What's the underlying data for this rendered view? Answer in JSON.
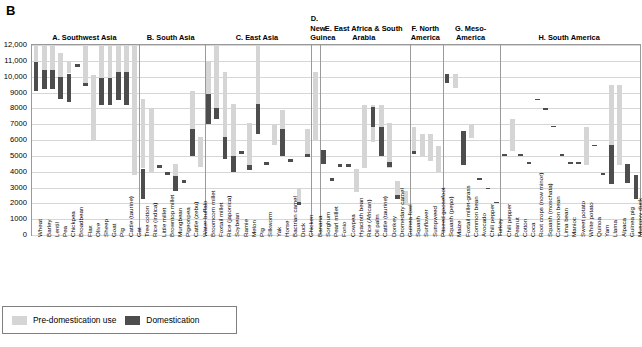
{
  "panel_letter": "B",
  "axis": {
    "ylabel": "Years BP",
    "ymin": 0,
    "ymax": 12000,
    "yticks": [
      "0",
      "1000",
      "2000",
      "3000",
      "4000",
      "5000",
      "6000",
      "7000",
      "8000",
      "9000",
      "10,000",
      "11,000",
      "12,000"
    ],
    "ytick_values": [
      0,
      1000,
      2000,
      3000,
      4000,
      5000,
      6000,
      7000,
      8000,
      9000,
      10000,
      11000,
      12000
    ]
  },
  "legend": {
    "position": "bottom-left",
    "items": [
      {
        "key": "pre",
        "label": "Pre-domestication use",
        "color": "#d5d5d5"
      },
      {
        "key": "dom",
        "label": "Domestication",
        "color": "#4d4d4d"
      }
    ]
  },
  "chart_data": {
    "type": "bar",
    "orientation": "vertical-range",
    "title": "",
    "xlabel": "",
    "ylabel": "Years BP",
    "ylim": [
      0,
      12000
    ],
    "grid": true,
    "series": [
      {
        "name": "Pre-domestication use",
        "color": "#d5d5d5"
      },
      {
        "name": "Domestication",
        "color": "#4d4d4d"
      }
    ],
    "groups": [
      {
        "id": "A",
        "label": "A. Southwest Asia",
        "items": [
          {
            "name": "Wheat",
            "pre": [
              10900,
              12000
            ],
            "dom": [
              9100,
              10900
            ]
          },
          {
            "name": "Barley",
            "pre": [
              10400,
              12000
            ],
            "dom": [
              9200,
              10400
            ]
          },
          {
            "name": "Lentil",
            "pre": [
              10400,
              12000
            ],
            "dom": [
              9200,
              10400
            ]
          },
          {
            "name": "Pea",
            "pre": [
              10000,
              11500
            ],
            "dom": [
              8600,
              10000
            ]
          },
          {
            "name": "Chickpea",
            "pre": [
              10200,
              10900
            ],
            "dom": [
              8400,
              10200
            ]
          },
          {
            "name": "Broadbean",
            "pre": null,
            "dom": [
              10600,
              10800
            ]
          },
          {
            "name": "Flax",
            "pre": [
              9500,
              12000
            ],
            "dom": [
              9400,
              9600
            ]
          },
          {
            "name": "Olive",
            "pre": [
              6000,
              10100
            ],
            "dom": null
          },
          {
            "name": "Sheep",
            "pre": [
              9900,
              12000
            ],
            "dom": [
              8200,
              9900
            ]
          },
          {
            "name": "Goat",
            "pre": [
              9900,
              12000
            ],
            "dom": [
              8200,
              9900
            ]
          },
          {
            "name": "Pig",
            "pre": [
              10300,
              12000
            ],
            "dom": [
              8500,
              10300
            ]
          },
          {
            "name": "Cattle (taurine)",
            "pre": [
              10300,
              12000
            ],
            "dom": [
              8200,
              10300
            ]
          },
          {
            "name": "Cat",
            "pre": [
              3800,
              12000
            ],
            "dom": null
          }
        ]
      },
      {
        "id": "B",
        "label": "B. South Asia",
        "items": [
          {
            "name": "Tree cotton",
            "pre": [
              4200,
              8600
            ],
            "dom": [
              2300,
              4200
            ]
          },
          {
            "name": "Rice (indica)",
            "pre": [
              4000,
              8000
            ],
            "dom": null
          },
          {
            "name": "Little millet",
            "pre": null,
            "dom": [
              4200,
              4400
            ]
          },
          {
            "name": "Browntop millet",
            "pre": null,
            "dom": [
              3800,
              4000
            ]
          },
          {
            "name": "Mungbean",
            "pre": [
              3700,
              4500
            ],
            "dom": [
              2800,
              3700
            ]
          },
          {
            "name": "Pigeonpea",
            "pre": null,
            "dom": [
              3300,
              3500
            ]
          },
          {
            "name": "Cattle (zebu)",
            "pre": [
              6700,
              9100
            ],
            "dom": [
              5000,
              6700
            ]
          },
          {
            "name": "Water buffalo",
            "pre": [
              4300,
              6200
            ],
            "dom": null
          }
        ]
      },
      {
        "id": "C",
        "label": "C. East Asia",
        "items": [
          {
            "name": "Broomcorn millet",
            "pre": [
              8900,
              11000
            ],
            "dom": [
              7000,
              8900
            ]
          },
          {
            "name": "Foxtail millet",
            "pre": [
              8000,
              12000
            ],
            "dom": [
              7300,
              8000
            ]
          },
          {
            "name": "Rice (japonica)",
            "pre": [
              6200,
              10300
            ],
            "dom": [
              4800,
              6200
            ]
          },
          {
            "name": "Soybean",
            "pre": [
              5000,
              8300
            ],
            "dom": [
              4000,
              5000
            ]
          },
          {
            "name": "Ramie",
            "pre": null,
            "dom": [
              5100,
              5300
            ]
          },
          {
            "name": "Melon",
            "pre": [
              4100,
              7100
            ],
            "dom": [
              4100,
              4400
            ]
          },
          {
            "name": "Pig",
            "pre": [
              8300,
              12000
            ],
            "dom": [
              6400,
              8300
            ]
          },
          {
            "name": "Silkworm",
            "pre": null,
            "dom": [
              4400,
              4600
            ]
          },
          {
            "name": "Yak",
            "pre": [
              5700,
              7000
            ],
            "dom": null
          },
          {
            "name": "Horse",
            "pre": [
              6700,
              7900
            ],
            "dom": [
              5000,
              6700
            ]
          },
          {
            "name": "Bactrian camel",
            "pre": null,
            "dom": [
              4600,
              4800
            ]
          },
          {
            "name": "Duck",
            "pre": [
              2000,
              3000
            ],
            "dom": [
              1900,
              2100
            ]
          },
          {
            "name": "Chicken",
            "pre": [
              5000,
              6700
            ],
            "dom": [
              4900,
              5100
            ]
          }
        ]
      },
      {
        "id": "D",
        "label": "D. New Guinea",
        "items": [
          {
            "name": "Banana",
            "pre": [
              6000,
              10300
            ],
            "dom": null
          }
        ]
      },
      {
        "id": "E",
        "label": "E. East Africa & South Arabia",
        "items": [
          {
            "name": "Sorghum",
            "pre": null,
            "dom": [
              4500,
              5400
            ]
          },
          {
            "name": "Pearl millet",
            "pre": null,
            "dom": [
              3400,
              3600
            ]
          },
          {
            "name": "Fonio",
            "pre": null,
            "dom": [
              4300,
              4500
            ]
          },
          {
            "name": "Cowpea",
            "pre": null,
            "dom": [
              4300,
              4500
            ]
          },
          {
            "name": "Hyacinth bean",
            "pre": [
              2700,
              4200
            ],
            "dom": null
          },
          {
            "name": "Rice (African)",
            "pre": [
              4200,
              8200
            ],
            "dom": null
          },
          {
            "name": "Oil palm",
            "pre": [
              5900,
              8200
            ],
            "dom": [
              6800,
              8100
            ]
          },
          {
            "name": "Cattle (taurine)",
            "pre": [
              5000,
              8200
            ],
            "dom": [
              5000,
              6800
            ]
          },
          {
            "name": "Donkey",
            "pre": [
              4200,
              7100
            ],
            "dom": [
              4300,
              4600
            ]
          },
          {
            "name": "Dromedary camel",
            "pre": [
              2300,
              3400
            ],
            "dom": [
              2300,
              2500
            ]
          },
          {
            "name": "Guinea fowl",
            "pre": [
              1900,
              2800
            ],
            "dom": null
          }
        ]
      },
      {
        "id": "F",
        "label": "F. North America",
        "items": [
          {
            "name": "Squash",
            "pre": [
              5200,
              6800
            ],
            "dom": [
              5100,
              5300
            ]
          },
          {
            "name": "Sunflower",
            "pre": [
              5000,
              6400
            ],
            "dom": null
          },
          {
            "name": "Sumpweed",
            "pre": [
              4700,
              6400
            ],
            "dom": null
          },
          {
            "name": "Pitseed goosefoot",
            "pre": [
              4000,
              5600
            ],
            "dom": null
          }
        ]
      },
      {
        "id": "G",
        "label": "G. Meso-America",
        "items": [
          {
            "name": "Squash (pepo)",
            "pre": null,
            "dom": [
              9600,
              10200
            ]
          },
          {
            "name": "Maize",
            "pre": [
              9300,
              10200
            ],
            "dom": null
          },
          {
            "name": "Foxtail millet-grass",
            "pre": null,
            "dom": [
              4400,
              6600
            ]
          },
          {
            "name": "Common bean",
            "pre": [
              6100,
              7000
            ],
            "dom": null
          },
          {
            "name": "Avocado",
            "pre": null,
            "dom": [
              3500,
              3600
            ]
          },
          {
            "name": "Chili pepper",
            "pre": null,
            "dom": [
              2900,
              3000
            ]
          },
          {
            "name": "Turkey",
            "pre": null,
            "dom": [
              2000,
              2100
            ]
          }
        ]
      },
      {
        "id": "H",
        "label": "H. South America",
        "items": [
          {
            "name": "Chili pepper",
            "pre": null,
            "dom": [
              5000,
              5100
            ]
          },
          {
            "name": "Peanut",
            "pre": [
              5300,
              7300
            ],
            "dom": null
          },
          {
            "name": "Cotton",
            "pre": null,
            "dom": [
              5000,
              5100
            ]
          },
          {
            "name": "Coca",
            "pre": null,
            "dom": [
              4500,
              4600
            ]
          },
          {
            "name": "Root crops (now minor)",
            "pre": null,
            "dom": [
              8500,
              8600
            ]
          },
          {
            "name": "Squash (moschata)",
            "pre": null,
            "dom": [
              7900,
              8000
            ]
          },
          {
            "name": "Common bean",
            "pre": null,
            "dom": [
              6800,
              6900
            ]
          },
          {
            "name": "Lima bean",
            "pre": null,
            "dom": [
              5000,
              5100
            ]
          },
          {
            "name": "Manioc",
            "pre": null,
            "dom": [
              4500,
              4600
            ]
          },
          {
            "name": "Sweet potato",
            "pre": null,
            "dom": [
              4500,
              4600
            ]
          },
          {
            "name": "White potato",
            "pre": [
              4400,
              6800
            ],
            "dom": null
          },
          {
            "name": "Quinoa",
            "pre": null,
            "dom": [
              5600,
              5700
            ]
          },
          {
            "name": "Yam",
            "pre": null,
            "dom": [
              3800,
              3900
            ]
          },
          {
            "name": "Llama",
            "pre": [
              5700,
              9500
            ],
            "dom": [
              3200,
              5700
            ]
          },
          {
            "name": "Alpaca",
            "pre": [
              4400,
              9500
            ],
            "dom": null
          },
          {
            "name": "Guinea pig",
            "pre": null,
            "dom": [
              3300,
              4500
            ]
          },
          {
            "name": "Muscovy duck",
            "pre": null,
            "dom": [
              2300,
              3800
            ]
          }
        ]
      }
    ]
  }
}
